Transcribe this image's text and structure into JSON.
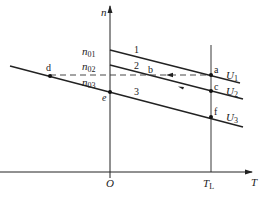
{
  "diagram": {
    "axes": {
      "y_label": "n",
      "x_label": "T",
      "origin_label": "O",
      "load_torque_label": "T",
      "load_torque_subscript": "L"
    },
    "y_ticks": [
      {
        "base": "n",
        "sub": "01"
      },
      {
        "base": "n",
        "sub": "02"
      },
      {
        "base": "n",
        "sub": "03"
      }
    ],
    "curves": [
      {
        "number": "1",
        "voltage_base": "U",
        "voltage_sub": "1"
      },
      {
        "number": "2",
        "voltage_base": "U",
        "voltage_sub": "2"
      },
      {
        "number": "3",
        "voltage_base": "U",
        "voltage_sub": "3"
      }
    ],
    "points": {
      "a": "a",
      "b": "b",
      "c": "c",
      "d": "d",
      "e": "e",
      "f": "f"
    },
    "colors": {
      "line": "#222222",
      "background": "#ffffff"
    }
  }
}
